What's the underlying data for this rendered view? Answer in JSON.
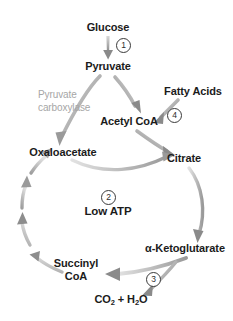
{
  "diagram": {
    "background_color": "#ffffff",
    "text_color": "#1b1b1b",
    "enzyme_text_color": "#a6a6a6",
    "arrow_color_dark": "#6f6f6f",
    "arrow_color_light": "#cfcfcf",
    "nodes": {
      "glucose": "Glucose",
      "pyruvate": "Pyruvate",
      "acetyl_coa": "Acetyl CoA",
      "fatty_acids": "Fatty Acids",
      "oxaloacetate": "Oxaloacetate",
      "citrate": "Citrate",
      "alpha_ketoglutarate": "α-Ketoglutarate",
      "succinyl_coa_line1": "Succinyl",
      "succinyl_coa_line2": "CoA",
      "co2_h2o_prefix": "CO",
      "co2_sub": "2",
      "co2_h2o_middle": " + H",
      "h2o_sub": "2",
      "co2_h2o_suffix": "O",
      "low_atp": "Low ATP"
    },
    "enzyme_labels": {
      "pyruvate_carboxylase_line1": "Pyruvate",
      "pyruvate_carboxylase_line2": "carboxylase"
    },
    "step_numbers": {
      "step1": "1",
      "step2": "2",
      "step3": "3",
      "step4": "4"
    }
  }
}
